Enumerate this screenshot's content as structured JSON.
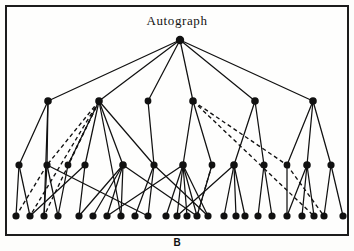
{
  "figure": {
    "title": "Autograph",
    "caption": "B",
    "frame": {
      "border_color": "#1c1c1c",
      "border_width_px": 2,
      "x": 5,
      "y": 5,
      "width": 344,
      "height": 231
    },
    "background_color": "#fefefd"
  },
  "chart_data": {
    "type": "diagram",
    "diagram_kind": "hierarchical-node-link-tree",
    "title": "Autograph",
    "caption": "B",
    "node_color": "#111111",
    "edge_color": "#111111",
    "solid_edge_label": "hierarchy link",
    "dashed_edge_label": "cross link",
    "levels": [
      {
        "name": "root",
        "y": 38,
        "count": 1
      },
      {
        "name": "level-1",
        "y": 99,
        "count": 6
      },
      {
        "name": "level-2",
        "y": 163,
        "count": 13
      },
      {
        "name": "leaves",
        "y": 214,
        "count": 27
      }
    ],
    "nodes": [
      {
        "id": "r",
        "x": 178,
        "y": 38,
        "level": 0,
        "r": 4.2
      },
      {
        "id": "a0",
        "x": 46,
        "y": 99,
        "level": 1,
        "r": 3.8
      },
      {
        "id": "a1",
        "x": 97,
        "y": 99,
        "level": 1,
        "r": 3.8
      },
      {
        "id": "a2",
        "x": 146,
        "y": 99,
        "level": 1,
        "r": 3.4
      },
      {
        "id": "a3",
        "x": 191,
        "y": 99,
        "level": 1,
        "r": 3.8
      },
      {
        "id": "a4",
        "x": 253,
        "y": 99,
        "level": 1,
        "r": 3.8
      },
      {
        "id": "a5",
        "x": 311,
        "y": 99,
        "level": 1,
        "r": 3.8
      },
      {
        "id": "b0",
        "x": 17,
        "y": 163,
        "level": 2,
        "r": 3.6
      },
      {
        "id": "b1",
        "x": 45,
        "y": 163,
        "level": 2,
        "r": 3.6
      },
      {
        "id": "b2",
        "x": 66,
        "y": 163,
        "level": 2,
        "r": 3.4
      },
      {
        "id": "b3",
        "x": 83,
        "y": 163,
        "level": 2,
        "r": 3.6
      },
      {
        "id": "b4",
        "x": 121,
        "y": 163,
        "level": 2,
        "r": 3.8
      },
      {
        "id": "b5",
        "x": 152,
        "y": 163,
        "level": 2,
        "r": 3.6
      },
      {
        "id": "b6",
        "x": 181,
        "y": 163,
        "level": 2,
        "r": 3.8
      },
      {
        "id": "b7",
        "x": 210,
        "y": 163,
        "level": 2,
        "r": 3.4
      },
      {
        "id": "b8",
        "x": 232,
        "y": 163,
        "level": 2,
        "r": 3.8
      },
      {
        "id": "b9",
        "x": 262,
        "y": 163,
        "level": 2,
        "r": 3.6
      },
      {
        "id": "b10",
        "x": 285,
        "y": 163,
        "level": 2,
        "r": 3.4
      },
      {
        "id": "b11",
        "x": 305,
        "y": 163,
        "level": 2,
        "r": 3.8
      },
      {
        "id": "b12",
        "x": 329,
        "y": 163,
        "level": 2,
        "r": 3.6
      },
      {
        "id": "c0",
        "x": 14,
        "y": 214,
        "level": 3,
        "r": 3.6
      },
      {
        "id": "c1",
        "x": 28,
        "y": 214,
        "level": 3,
        "r": 3.6
      },
      {
        "id": "c2",
        "x": 42,
        "y": 214,
        "level": 3,
        "r": 3.6
      },
      {
        "id": "c3",
        "x": 56,
        "y": 214,
        "level": 3,
        "r": 3.6
      },
      {
        "id": "c4",
        "x": 77,
        "y": 214,
        "level": 3,
        "r": 3.6
      },
      {
        "id": "c5",
        "x": 91,
        "y": 214,
        "level": 3,
        "r": 3.6
      },
      {
        "id": "c6",
        "x": 105,
        "y": 214,
        "level": 3,
        "r": 3.6
      },
      {
        "id": "c7",
        "x": 119,
        "y": 214,
        "level": 3,
        "r": 3.6
      },
      {
        "id": "c8",
        "x": 133,
        "y": 214,
        "level": 3,
        "r": 3.6
      },
      {
        "id": "c9",
        "x": 146,
        "y": 214,
        "level": 3,
        "r": 3.6
      },
      {
        "id": "c10",
        "x": 164,
        "y": 214,
        "level": 3,
        "r": 3.6
      },
      {
        "id": "c11",
        "x": 175,
        "y": 214,
        "level": 3,
        "r": 3.6
      },
      {
        "id": "c12",
        "x": 185,
        "y": 214,
        "level": 3,
        "r": 3.6
      },
      {
        "id": "c13",
        "x": 195,
        "y": 214,
        "level": 3,
        "r": 3.6
      },
      {
        "id": "c14",
        "x": 206,
        "y": 214,
        "level": 3,
        "r": 3.6
      },
      {
        "id": "c15",
        "x": 222,
        "y": 214,
        "level": 3,
        "r": 3.6
      },
      {
        "id": "c16",
        "x": 234,
        "y": 214,
        "level": 3,
        "r": 3.6
      },
      {
        "id": "c17",
        "x": 243,
        "y": 214,
        "level": 3,
        "r": 3.6
      },
      {
        "id": "c18",
        "x": 256,
        "y": 214,
        "level": 3,
        "r": 3.6
      },
      {
        "id": "c19",
        "x": 270,
        "y": 214,
        "level": 3,
        "r": 3.6
      },
      {
        "id": "c20",
        "x": 285,
        "y": 214,
        "level": 3,
        "r": 3.6
      },
      {
        "id": "c21",
        "x": 300,
        "y": 214,
        "level": 3,
        "r": 3.6
      },
      {
        "id": "c22",
        "x": 312,
        "y": 214,
        "level": 3,
        "r": 3.6
      },
      {
        "id": "c23",
        "x": 322,
        "y": 214,
        "level": 3,
        "r": 3.6
      },
      {
        "id": "c24",
        "x": 341,
        "y": 214,
        "level": 3,
        "r": 3.6
      }
    ],
    "edges_solid": [
      [
        "r",
        "a0"
      ],
      [
        "r",
        "a1"
      ],
      [
        "r",
        "a2"
      ],
      [
        "r",
        "a3"
      ],
      [
        "r",
        "a4"
      ],
      [
        "r",
        "a5"
      ],
      [
        "a0",
        "b0"
      ],
      [
        "a0",
        "b1"
      ],
      [
        "a1",
        "b2"
      ],
      [
        "a1",
        "b3"
      ],
      [
        "a1",
        "b4"
      ],
      [
        "a1",
        "b5"
      ],
      [
        "a2",
        "b5"
      ],
      [
        "a3",
        "b6"
      ],
      [
        "a3",
        "b7"
      ],
      [
        "a4",
        "b8"
      ],
      [
        "a4",
        "b9"
      ],
      [
        "a5",
        "b10"
      ],
      [
        "a5",
        "b11"
      ],
      [
        "a5",
        "b12"
      ],
      [
        "b0",
        "c0"
      ],
      [
        "b0",
        "c1"
      ],
      [
        "b1",
        "c2"
      ],
      [
        "b1",
        "c3"
      ],
      [
        "b2",
        "c3"
      ],
      [
        "b3",
        "c4"
      ],
      [
        "b4",
        "c4"
      ],
      [
        "b4",
        "c5"
      ],
      [
        "b4",
        "c6"
      ],
      [
        "b4",
        "c7"
      ],
      [
        "b5",
        "c8"
      ],
      [
        "b5",
        "c9"
      ],
      [
        "b6",
        "c10"
      ],
      [
        "b6",
        "c11"
      ],
      [
        "b6",
        "c12"
      ],
      [
        "b6",
        "c13"
      ],
      [
        "b6",
        "c14"
      ],
      [
        "b7",
        "c13"
      ],
      [
        "b8",
        "c15"
      ],
      [
        "b8",
        "c16"
      ],
      [
        "b8",
        "c17"
      ],
      [
        "b9",
        "c18"
      ],
      [
        "b9",
        "c19"
      ],
      [
        "b10",
        "c20"
      ],
      [
        "b11",
        "c20"
      ],
      [
        "b11",
        "c21"
      ],
      [
        "b11",
        "c22"
      ],
      [
        "b12",
        "c23"
      ],
      [
        "b12",
        "c24"
      ],
      [
        "a0",
        "c2"
      ],
      [
        "a1",
        "c7"
      ],
      [
        "b1",
        "c9"
      ],
      [
        "b3",
        "c1"
      ],
      [
        "b5",
        "c14"
      ],
      [
        "b6",
        "c6"
      ],
      [
        "b8",
        "c11"
      ],
      [
        "b4",
        "c13"
      ]
    ],
    "edges_dashed": [
      [
        "a1",
        "b1"
      ],
      [
        "a1",
        "b2"
      ],
      [
        "a1",
        "c2"
      ],
      [
        "a1",
        "c1"
      ],
      [
        "a3",
        "b10"
      ],
      [
        "a3",
        "c22"
      ],
      [
        "b7",
        "c13"
      ],
      [
        "b10",
        "c23"
      ],
      [
        "b1",
        "c0"
      ]
    ],
    "notes": {
      "solid_edge_count": 57,
      "dashed_edge_count": 9,
      "node_count": 45
    }
  }
}
